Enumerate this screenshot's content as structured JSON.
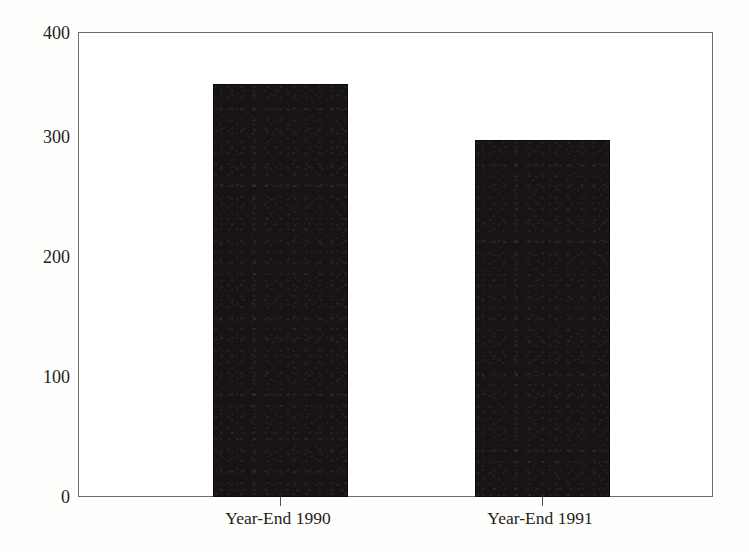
{
  "chart_data": {
    "type": "bar",
    "title": "",
    "xlabel": "",
    "ylabel": "Billions of Dollars",
    "categories": [
      "Year-End 1990",
      "Year-End 1991"
    ],
    "values": [
      355,
      307
    ],
    "ylim": [
      0,
      400
    ],
    "yticks": [
      0,
      100,
      200,
      300,
      400
    ],
    "ytick_labels": [
      "0",
      "100",
      "200",
      "300",
      "400"
    ],
    "grid": false,
    "legend": null,
    "series": [
      {
        "name": "",
        "values": [
          355,
          307
        ],
        "color": "#181414"
      }
    ]
  },
  "axes": {
    "y_title": "Billions of Dollars",
    "y_ticks": [
      {
        "label": "400",
        "value": 400
      },
      {
        "label": "300",
        "value": 300
      },
      {
        "label": "200",
        "value": 200
      },
      {
        "label": "100",
        "value": 100
      },
      {
        "label": "0",
        "value": 0
      }
    ],
    "x_ticks": [
      {
        "label": "Year-End 1990"
      },
      {
        "label": "Year-End 1991"
      }
    ]
  },
  "colors": {
    "bar_fill": "#181414",
    "frame": "#6e6b69",
    "text": "#262220",
    "background": "#ffffff"
  }
}
